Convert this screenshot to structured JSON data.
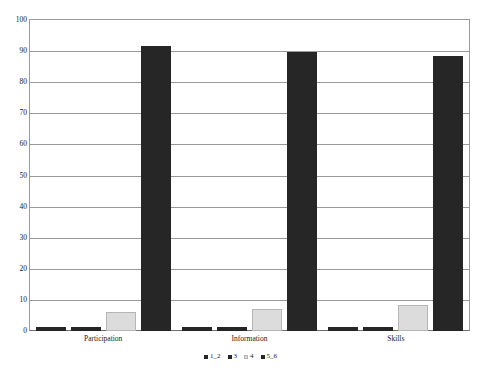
{
  "chart_data": {
    "type": "bar",
    "title": "",
    "xlabel": "",
    "ylabel": "",
    "ylim": [
      0,
      100
    ],
    "ytick_step": 10,
    "yticks": [
      100,
      90,
      80,
      70,
      60,
      50,
      40,
      30,
      20,
      10,
      0
    ],
    "ytick_labels": [
      "100",
      "90",
      "80",
      "70",
      "60",
      "50",
      "40",
      "30",
      "20",
      "10",
      "0"
    ],
    "grid": true,
    "legend_position": "bottom",
    "categories": [
      "Participation",
      "Information",
      "Skills"
    ],
    "series": [
      {
        "name": "1_2",
        "color": "#262626",
        "values": [
          1.3,
          1.3,
          1.3
        ]
      },
      {
        "name": "3",
        "color": "#262626",
        "values": [
          1.3,
          1.3,
          1.3
        ]
      },
      {
        "name": "4",
        "color": "#dcdcdc",
        "values": [
          6.0,
          7.0,
          8.5
        ]
      },
      {
        "name": "5_6",
        "color": "#262626",
        "values": [
          91.5,
          89.8,
          88.5
        ]
      }
    ]
  },
  "colors": {
    "dark_bar": "#262626",
    "light_bar": "#dcdcdc",
    "light_bar_border": "#b6b6b6",
    "gridline": "#9a9a9a",
    "axis": "#6e6e6e",
    "background": "#ffffff",
    "text": "#1a1a1a"
  }
}
